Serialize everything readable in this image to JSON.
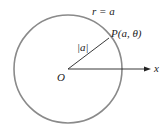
{
  "diagram": {
    "circle_label": "r = a",
    "point_label": "P(a, θ)",
    "radius_label": "|a|",
    "origin_label": "O",
    "axis_label": "x",
    "colors": {
      "circle": "#8a8a8a",
      "lines": "#222222",
      "background": "#ffffff"
    }
  }
}
